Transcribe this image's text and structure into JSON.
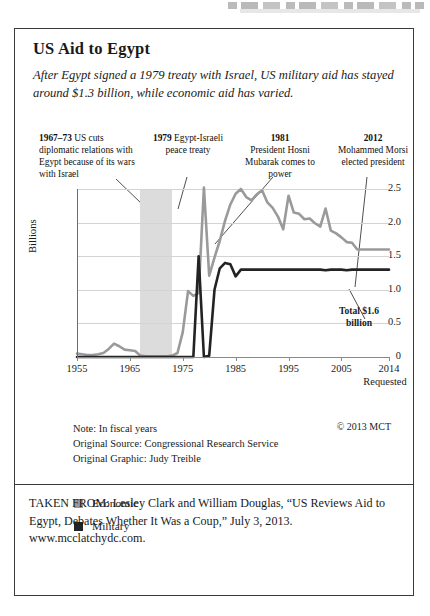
{
  "panel": {
    "title": "US Aid to Egypt",
    "subtitle": "After Egypt signed a 1979 treaty with Israel, US military aid has stayed around $1.3 billion, while economic aid has varied."
  },
  "annotations": [
    {
      "id": "a1967",
      "year_label": "1967–73",
      "text": " US cuts diplomatic relations with Egypt because of its wars with Israel"
    },
    {
      "id": "a1979",
      "year_label": "1979",
      "text": " Egypt-Israeli peace treaty"
    },
    {
      "id": "a1981",
      "year_label": "1981",
      "text": "President Hosni Mubarak comes to power"
    },
    {
      "id": "a2012",
      "year_label": "2012",
      "text": "Mohammed Morsi elected president"
    }
  ],
  "chart_data": {
    "type": "line",
    "title": "US Aid to Egypt",
    "xlabel": "",
    "ylabel": "Billions",
    "xlim": [
      1955,
      2014
    ],
    "ylim": [
      0,
      2.5
    ],
    "grid": true,
    "legend_position": "below",
    "xticks": [
      1955,
      1965,
      1975,
      1985,
      1995,
      2005,
      2014
    ],
    "xtick_labels": [
      "1955",
      "1965",
      "1975",
      "1985",
      "1995",
      "2005",
      "2014"
    ],
    "xtick_sublabel": "Requested",
    "yticks": [
      0,
      0.5,
      1.0,
      1.5,
      2.0,
      2.5
    ],
    "ytick_labels": [
      "0",
      "0.5",
      "1.0",
      "1.5",
      "2.0",
      "2.5"
    ],
    "shaded_region": {
      "label": "1967–73 US cuts diplomatic relations",
      "x_start": 1967,
      "x_end": 1973,
      "color": "#dcdcdc"
    },
    "annotation_on_plot": "Total $1.6 billion",
    "x": [
      1955,
      1956,
      1957,
      1958,
      1959,
      1960,
      1961,
      1962,
      1963,
      1964,
      1965,
      1966,
      1967,
      1968,
      1969,
      1970,
      1971,
      1972,
      1973,
      1974,
      1975,
      1976,
      1977,
      1978,
      1979,
      1980,
      1981,
      1982,
      1983,
      1984,
      1985,
      1986,
      1987,
      1988,
      1989,
      1990,
      1991,
      1992,
      1993,
      1994,
      1995,
      1996,
      1997,
      1998,
      1999,
      2000,
      2001,
      2002,
      2003,
      2004,
      2005,
      2006,
      2007,
      2008,
      2009,
      2010,
      2011,
      2012,
      2013,
      2014
    ],
    "series": [
      {
        "name": "Economic",
        "color": "#9a9a9a",
        "values": [
          0.05,
          0.04,
          0.03,
          0.03,
          0.04,
          0.06,
          0.12,
          0.2,
          0.16,
          0.11,
          0.1,
          0.09,
          0.02,
          0.01,
          0.01,
          0.01,
          0.01,
          0.01,
          0.02,
          0.06,
          0.37,
          0.98,
          0.91,
          0.95,
          2.52,
          1.21,
          1.48,
          1.73,
          2.03,
          2.27,
          2.43,
          2.5,
          2.38,
          2.33,
          2.42,
          2.48,
          2.3,
          2.22,
          2.09,
          1.9,
          2.4,
          2.15,
          2.13,
          2.05,
          2.06,
          1.99,
          1.94,
          2.21,
          1.88,
          1.84,
          1.78,
          1.71,
          1.7,
          1.6,
          1.6,
          1.6,
          1.6,
          1.6,
          1.6,
          1.6
        ]
      },
      {
        "name": "Military",
        "color": "#232323",
        "values": [
          0,
          0,
          0,
          0,
          0,
          0,
          0,
          0,
          0,
          0,
          0,
          0,
          0,
          0,
          0,
          0,
          0,
          0,
          0,
          0,
          0,
          0,
          0,
          1.5,
          0.0,
          0.02,
          1.0,
          1.32,
          1.4,
          1.38,
          1.2,
          1.3,
          1.3,
          1.3,
          1.3,
          1.3,
          1.3,
          1.3,
          1.3,
          1.3,
          1.3,
          1.3,
          1.3,
          1.3,
          1.3,
          1.3,
          1.3,
          1.29,
          1.3,
          1.3,
          1.3,
          1.29,
          1.3,
          1.3,
          1.3,
          1.3,
          1.3,
          1.3,
          1.3,
          1.3
        ]
      }
    ]
  },
  "notes": {
    "line1": "Note: In fiscal years",
    "line2": "Original Source: Congressional Research Service",
    "line3": "Original Graphic: Judy Treible",
    "copyright": "© 2013 MCT"
  },
  "legend": [
    {
      "label": "Economic",
      "color": "#9a9a9a"
    },
    {
      "label": "Military",
      "color": "#232323"
    }
  ],
  "citation": "TAKEN FROM: Lesley Clark and William Douglas, “US Reviews Aid to Egypt, Debates Whether It Was a Coup,” July 3, 2013. www.mcclatchydc.com."
}
